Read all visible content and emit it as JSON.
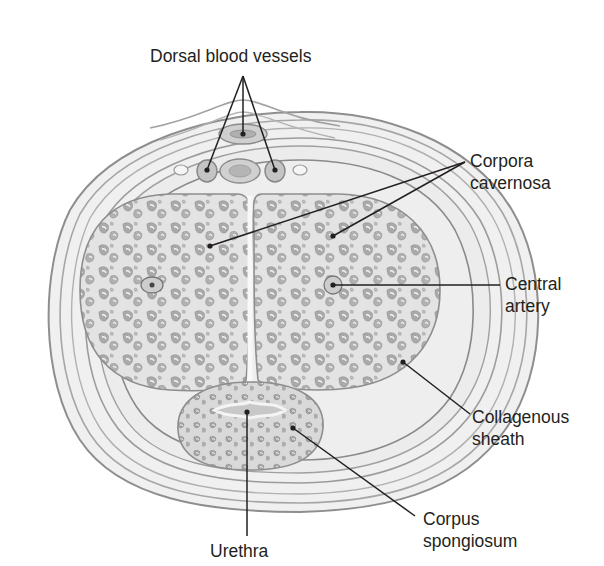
{
  "figure": {
    "type": "anatomical cross-section illustration",
    "background": "#ffffff",
    "colors": {
      "sheath_fill": "#ededed",
      "sheath_lines": "#9a9a9a",
      "tissue_fill": "#e2e2e2",
      "sinus_fill": "#a8a8a8",
      "sinus_highlight": "#f4f4f4",
      "leader_line": "#231f20",
      "text": "#231f20"
    }
  },
  "labels": {
    "dorsal_vessels": {
      "line1": "Dorsal blood vessels"
    },
    "corpora_cavernosa": {
      "line1": "Corpora",
      "line2": "cavernosa"
    },
    "central_artery": {
      "line1": "Central",
      "line2": "artery"
    },
    "collagenous_sheath": {
      "line1": "Collagenous",
      "line2": "sheath"
    },
    "corpus_spongiosum": {
      "line1": "Corpus",
      "line2": "spongiosum"
    },
    "urethra": {
      "line1": "Urethra"
    }
  }
}
